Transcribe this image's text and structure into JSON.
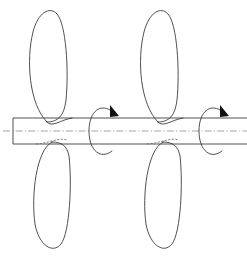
{
  "figure": {
    "background_color": "#ffffff",
    "line_color": "#3c3c3c",
    "centerline_color": "#9a9a9a",
    "hidden_line_color": "#6e6e6e",
    "arrow_color": "#111111",
    "width": 247,
    "height": 256,
    "caption": "",
    "labels": []
  },
  "shaft": {
    "name": "drive-shaft",
    "left_x": 13,
    "right_x": 247,
    "top_y": 118,
    "bottom_y": 144,
    "axis_y": 131,
    "closed_left_end": true,
    "open_right_end": true,
    "line_style": "solid"
  },
  "centerline": {
    "name": "axis-of-rotation",
    "style": "dash-dot",
    "from_x": 3,
    "to_x": 247,
    "y": 131
  },
  "blades": [
    {
      "id": "blade-1",
      "label": "",
      "station": "front-rotor",
      "position": "upper",
      "hub_x": 49,
      "root_y": 122,
      "tip_y": 10,
      "half_width": 22,
      "tilt": -2
    },
    {
      "id": "blade-2",
      "label": "",
      "station": "front-rotor",
      "position": "lower",
      "hub_x": 52,
      "root_y": 142,
      "tip_y": 250,
      "half_width": 22,
      "tilt": 2
    },
    {
      "id": "blade-3",
      "label": "",
      "station": "rear-rotor",
      "position": "upper",
      "hub_x": 160,
      "root_y": 122,
      "tip_y": 10,
      "half_width": 22,
      "tilt": -2
    },
    {
      "id": "blade-4",
      "label": "",
      "station": "rear-rotor",
      "position": "lower",
      "hub_x": 163,
      "root_y": 142,
      "tip_y": 250,
      "half_width": 22,
      "tilt": 2
    }
  ],
  "rotation_arrows": [
    {
      "id": "rotation-arrow-front",
      "label": "",
      "center_x": 103,
      "center_y": 131,
      "rx": 13,
      "ry": 25,
      "direction": "clockwise",
      "arrowhead_position": "top-right"
    },
    {
      "id": "rotation-arrow-rear",
      "label": "",
      "center_x": 213,
      "center_y": 131,
      "rx": 13,
      "ry": 25,
      "direction": "clockwise",
      "arrowhead_position": "top-right"
    }
  ],
  "hub_curves": [
    {
      "id": "hub-curve-front-top",
      "style": "solid"
    },
    {
      "id": "hub-curve-front-bottom",
      "style": "hidden-dashed"
    },
    {
      "id": "hub-curve-rear-top",
      "style": "solid"
    },
    {
      "id": "hub-curve-rear-bottom",
      "style": "hidden-dashed"
    }
  ]
}
